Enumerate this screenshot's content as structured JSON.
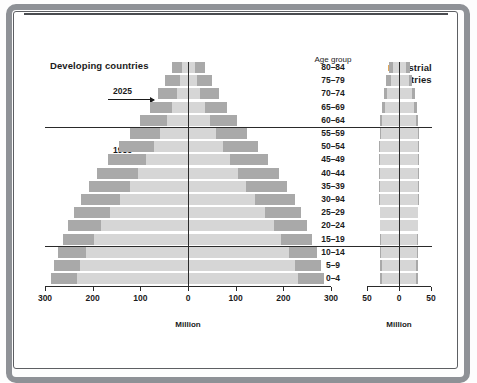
{
  "figure": {
    "left_panel_title": "Developing countries",
    "right_panel_title_line1": "Industrial",
    "right_panel_title_line2": "countries",
    "age_group_header": "Age group",
    "men_label": "Men",
    "women_label": "Women",
    "note_2025": "2025",
    "note_1985": "1985",
    "left_axis_title": "Million",
    "right_axis_title": "Million",
    "colors": {
      "projection_2025": "#a9a9a9",
      "baseline_1985": "#d6d6d6",
      "frame": "#8e9196",
      "ink": "#1b1b1b"
    }
  },
  "chart_data": [
    {
      "type": "bar",
      "title": "Developing countries",
      "subtitle": "",
      "xlabel": "Million",
      "ylabel": "Age group",
      "orientation": "horizontal",
      "layout": "population-pyramid",
      "xlim": [
        -300,
        300
      ],
      "xticks": [
        -300,
        -200,
        -100,
        0,
        100,
        200,
        300
      ],
      "xticklabels": [
        "300",
        "200",
        "100",
        "0",
        "100",
        "200",
        "300"
      ],
      "grid": false,
      "legend": "annotated",
      "annotations": [
        "2025",
        "1985",
        "Men",
        "Women"
      ],
      "categories": [
        "80–84",
        "75–79",
        "70–74",
        "65–69",
        "60–64",
        "55–59",
        "50–54",
        "45–49",
        "40–44",
        "35–39",
        "30–94",
        "25–29",
        "20–24",
        "15–19",
        "10–14",
        "5–9",
        "0–4"
      ],
      "series": [
        {
          "name": "2025",
          "side": "men",
          "values": [
            34,
            48,
            62,
            80,
            100,
            122,
            145,
            168,
            190,
            208,
            225,
            240,
            252,
            262,
            272,
            282,
            288
          ]
        },
        {
          "name": "2025",
          "side": "women",
          "values": [
            36,
            50,
            64,
            82,
            102,
            124,
            146,
            168,
            190,
            208,
            224,
            238,
            250,
            260,
            270,
            280,
            286
          ]
        },
        {
          "name": "1985",
          "side": "men",
          "values": [
            12,
            17,
            24,
            33,
            44,
            58,
            72,
            88,
            104,
            122,
            142,
            163,
            182,
            198,
            214,
            226,
            232
          ]
        },
        {
          "name": "1985",
          "side": "women",
          "values": [
            14,
            19,
            26,
            35,
            46,
            59,
            73,
            88,
            104,
            121,
            140,
            161,
            180,
            196,
            212,
            224,
            230
          ]
        }
      ]
    },
    {
      "type": "bar",
      "title": "Industrial countries",
      "subtitle": "",
      "xlabel": "Million",
      "ylabel": "Age group",
      "orientation": "horizontal",
      "layout": "population-pyramid",
      "xlim": [
        -50,
        50
      ],
      "xticks": [
        -50,
        0,
        50
      ],
      "xticklabels": [
        "50",
        "0",
        "50"
      ],
      "grid": false,
      "legend": "annotated",
      "categories": [
        "80–84",
        "75–79",
        "70–74",
        "65–69",
        "60–64",
        "55–59",
        "50–54",
        "45–49",
        "40–44",
        "35–39",
        "30–94",
        "25–29",
        "20–24",
        "15–19",
        "10–14",
        "5–9",
        "0–4"
      ],
      "series": [
        {
          "name": "2025",
          "side": "men",
          "values": [
            16,
            20,
            24,
            27,
            29,
            30,
            31,
            31,
            31,
            31,
            31,
            30,
            30,
            29,
            30,
            30,
            29
          ]
        },
        {
          "name": "2025",
          "side": "women",
          "values": [
            17,
            21,
            25,
            28,
            30,
            31,
            31,
            31,
            31,
            31,
            31,
            30,
            30,
            29,
            30,
            30,
            29
          ]
        },
        {
          "name": "1985",
          "side": "men",
          "values": [
            9,
            13,
            18,
            22,
            26,
            28,
            29,
            30,
            30,
            30,
            30,
            29,
            29,
            28,
            28,
            27,
            26
          ]
        },
        {
          "name": "1985",
          "side": "women",
          "values": [
            11,
            15,
            20,
            24,
            27,
            29,
            30,
            30,
            30,
            30,
            30,
            29,
            29,
            28,
            28,
            27,
            26
          ]
        }
      ]
    }
  ]
}
